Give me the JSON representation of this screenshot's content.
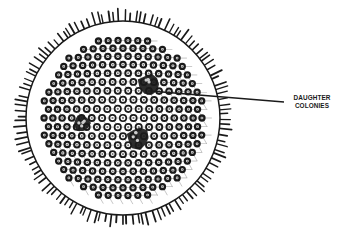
{
  "diagram": {
    "colors": {
      "ink": "#1a1a1a",
      "background": "#ffffff"
    },
    "sphere": {
      "cx": 123,
      "cy": 118,
      "r": 97
    },
    "daughter_colonies": [
      {
        "cx": 150,
        "cy": 84,
        "r": 11
      },
      {
        "cx": 82,
        "cy": 123,
        "r": 8
      },
      {
        "cx": 138,
        "cy": 138,
        "r": 11
      }
    ],
    "callout": {
      "line": {
        "x1": 150,
        "y1": 91,
        "x2": 284,
        "y2": 102
      },
      "label_lines": [
        "DAUGHTER",
        "COLONIES"
      ]
    }
  }
}
